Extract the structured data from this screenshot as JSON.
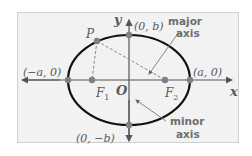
{
  "diagram": {
    "type": "ellipse-parts",
    "colors": {
      "background": "#f2f2f2",
      "frame_border": "#d0d0d0",
      "axis": "#555555",
      "ellipse": "#111111",
      "point": "#808080",
      "dashed": "#888888",
      "label": "#5a5a5a",
      "callout_text": "#6e6e6e"
    },
    "axes": {
      "x_label": "x",
      "y_label": "y",
      "origin_label": "O"
    },
    "points": {
      "P": {
        "label": "P"
      },
      "F1": {
        "label": "F",
        "subscript": "1"
      },
      "F2": {
        "label": "F",
        "subscript": "2"
      },
      "vertex_left": {
        "label": "(−a, 0)"
      },
      "vertex_right": {
        "label": "(a, 0)"
      },
      "covertex_top": {
        "label": "(0, b)"
      },
      "covertex_bottom": {
        "label": "(0, −b)"
      }
    },
    "callouts": {
      "major_axis": {
        "line1": "major",
        "line2": "axis"
      },
      "minor_axis": {
        "line1": "minor",
        "line2": "axis"
      }
    }
  }
}
